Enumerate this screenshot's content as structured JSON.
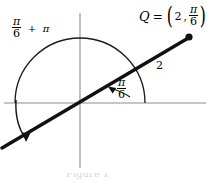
{
  "figure": {
    "background_color": "#ffffff",
    "axis_color": "#8c8c8c",
    "curve_color": "#1a1a1a",
    "ray_color": "#111111",
    "label_color": "#000000"
  },
  "labels": {
    "sweep": {
      "numerator": "π",
      "denominator": "6",
      "operator": "+",
      "term": "π",
      "full_text": "π/6 + π"
    },
    "point": {
      "name": "Q",
      "equals": "=",
      "open_paren": "(",
      "radius": "2",
      "comma": ",",
      "angle_numerator": "π",
      "angle_denominator": "6",
      "close_paren": ")",
      "full_text": "Q = (2, π/6)"
    },
    "angle": {
      "numerator": "π",
      "denominator": "6",
      "full_text": "π/6"
    },
    "radius": {
      "value": "2"
    },
    "caption": {
      "text": "Figure 1"
    }
  },
  "geometry": {
    "origin": {
      "x": 80,
      "y": 103
    },
    "circle_radius": 65,
    "ray_angle_degrees": 30,
    "point_q": {
      "x": 189,
      "y": 37
    },
    "x_axis": {
      "x1": 4,
      "x2": 206,
      "y": 103
    },
    "y_axis": {
      "x": 80,
      "y1": 13,
      "y2": 168
    }
  }
}
